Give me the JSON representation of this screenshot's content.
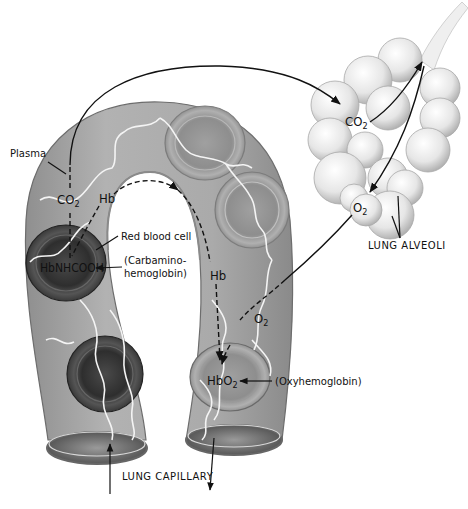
{
  "diagram": {
    "labels": {
      "plasma": "Plasma",
      "red_blood_cell": "Red blood cell",
      "carbamino_line1": "(Carbamino-",
      "carbamino_line2": "hemoglobin)",
      "oxyhemoglobin": "(Oxyhemoglobin)",
      "lung_alveoli": "LUNG ALVEOLI",
      "lung_capillary": "LUNG CAPILLARY"
    },
    "chemistry": {
      "co2_plasma": {
        "base": "CO",
        "sub": "2"
      },
      "hb_left": "Hb",
      "hbnhcooh": "HbNHCOOH",
      "hb_right": "Hb",
      "o2_capillary": {
        "base": "O",
        "sub": "2"
      },
      "hbo2": {
        "base": "HbO",
        "sub": "2"
      },
      "co2_alveoli": {
        "base": "CO",
        "sub": "2"
      },
      "o2_alveoli": {
        "base": "O",
        "sub": "2"
      }
    },
    "flows": [
      {
        "from": "HbNHCOOH",
        "to": "CO2 (plasma)",
        "style": "dashed"
      },
      {
        "from": "HbNHCOOH",
        "to": "Hb",
        "style": "dashed"
      },
      {
        "from": "Hb (left)",
        "to": "Hb (right)",
        "style": "dashed"
      },
      {
        "from": "CO2 (plasma)",
        "to": "CO2 (alveoli)",
        "style": "solid"
      },
      {
        "from": "CO2 (alveoli)",
        "to": "airway",
        "style": "solid"
      },
      {
        "from": "airway",
        "to": "O2 (alveoli)",
        "style": "solid"
      },
      {
        "from": "O2 (alveoli)",
        "to": "HbO2",
        "style": "solid-to-dashed"
      },
      {
        "from": "Hb (right)",
        "to": "HbO2",
        "style": "dashed"
      }
    ],
    "colors": {
      "capillary_fill": "#a8a8a8",
      "rbc_dark": "#3a3a3a",
      "rbc_light": "#9a9a9a",
      "alveoli_fill": "#e8e8e8",
      "line": "#111111"
    }
  }
}
